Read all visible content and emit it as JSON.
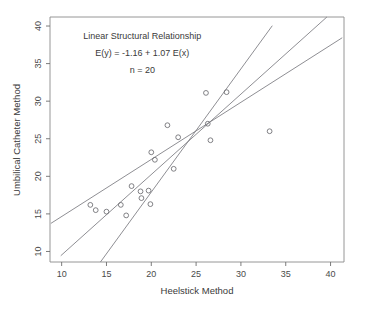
{
  "figure": {
    "width": 368,
    "height": 309,
    "background": "#ffffff",
    "marker_color": "#6b6b70",
    "line_color": "#7a7a80",
    "axis_color": "#6d6d6d"
  },
  "chart_data": {
    "type": "scatter",
    "title": "",
    "xlabel": "Heelstick Method",
    "ylabel": "Umbilical Catheter Method",
    "xlim": [
      8.7,
      41.5
    ],
    "ylim": [
      8.6,
      41.2
    ],
    "xticks": [
      "10",
      "15",
      "20",
      "25",
      "30",
      "35",
      "40"
    ],
    "xtick_values": [
      10,
      15,
      20,
      25,
      30,
      35,
      40
    ],
    "yticks": [
      "10",
      "15",
      "20",
      "25",
      "30",
      "35",
      "40"
    ],
    "ytick_values": [
      10,
      15,
      20,
      25,
      30,
      35,
      40
    ],
    "grid": false,
    "legend": null,
    "n": 20,
    "points": [
      {
        "x": 13.2,
        "y": 16.2
      },
      {
        "x": 13.8,
        "y": 15.5
      },
      {
        "x": 15.0,
        "y": 15.3
      },
      {
        "x": 16.6,
        "y": 16.2
      },
      {
        "x": 17.2,
        "y": 14.8
      },
      {
        "x": 17.8,
        "y": 18.7
      },
      {
        "x": 18.8,
        "y": 18.0
      },
      {
        "x": 18.9,
        "y": 17.1
      },
      {
        "x": 19.7,
        "y": 18.1
      },
      {
        "x": 19.9,
        "y": 16.3
      },
      {
        "x": 20.0,
        "y": 23.2
      },
      {
        "x": 20.4,
        "y": 22.2
      },
      {
        "x": 21.8,
        "y": 26.8
      },
      {
        "x": 23.0,
        "y": 25.2
      },
      {
        "x": 26.1,
        "y": 31.1
      },
      {
        "x": 26.3,
        "y": 27.0
      },
      {
        "x": 26.6,
        "y": 24.8
      },
      {
        "x": 28.4,
        "y": 31.2
      },
      {
        "x": 33.2,
        "y": 26.0
      },
      {
        "x": 22.5,
        "y": 21.0
      }
    ],
    "lines": [
      {
        "name": "structural-fit-line",
        "intercept": -1.16,
        "slope": 1.07,
        "x_start": 9.9,
        "x_end": 41.3
      },
      {
        "name": "upper-bound-line",
        "intercept": -14.9,
        "slope": 1.64,
        "x_start": 11.2,
        "x_end": 33.5
      },
      {
        "name": "lower-bound-line",
        "intercept": 7.05,
        "slope": 0.76,
        "x_start": 8.8,
        "x_end": 41.3
      }
    ],
    "annotations": [
      {
        "text": "Linear Structural Relationship",
        "x": 19.0,
        "y": 38.3
      },
      {
        "text": "E(y) =  -1.16  + 1.07 E(x)",
        "x": 19.0,
        "y": 36.0
      },
      {
        "text": "n = 20",
        "x": 19.0,
        "y": 33.7
      }
    ]
  },
  "axes": {
    "x_title": "Heelstick Method",
    "y_title": "Umbilical Catheter Method"
  },
  "annotation_lines": {
    "line1": "Linear Structural Relationship",
    "line2": "E(y) =  -1.16  + 1.07 E(x)",
    "line3": "n = 20"
  }
}
